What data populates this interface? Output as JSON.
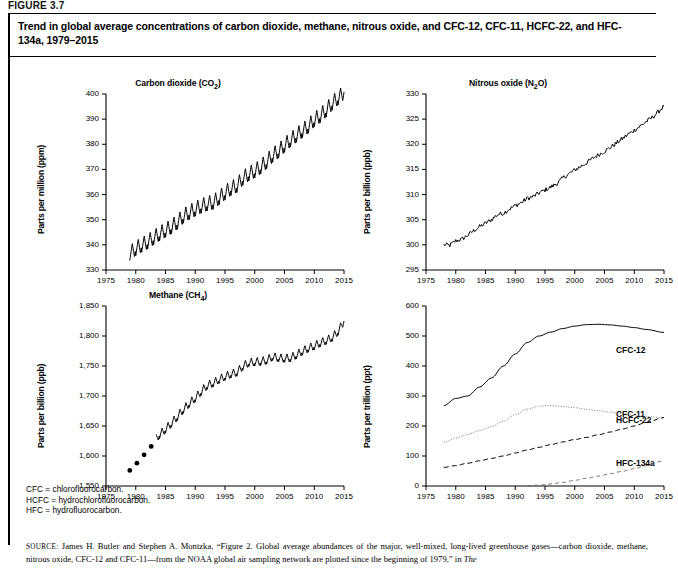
{
  "figure": {
    "label": "FIGURE 3.7",
    "title": "Trend in global average concentrations of carbon dioxide, methane, nitrous oxide, and CFC-12, CFC-11, HCFC-22, and HFC-134a, 1979–2015"
  },
  "notes": [
    "CFC = chlorofluorocarbon.",
    "HCFC = hydrochlorofluorocarbon.",
    "HFC = hydrofluorocarbon."
  ],
  "source": {
    "prefix": "SOURCE:",
    "text": " James H. Butler and Stephen A. Montzka, “Figure 2. Global average abundances of the major, well-mixed, long-lived greenhouse gases—carbon dioxide, methane, nitrous oxide, CFC-12 and CFC-11—from the NOAA global air sampling network are plotted since the beginning of 1979,” in ",
    "italic": "The"
  },
  "chart_data": [
    {
      "type": "line",
      "panel": "top-left",
      "title": "Carbon dioxide (CO₂)",
      "title_main": "Carbon dioxide (CO",
      "title_sub": "2",
      "title_end": ")",
      "ylabel": "Parts per million (ppm)",
      "xlabel": "",
      "ylim": [
        330,
        400
      ],
      "xlim": [
        1975,
        2015
      ],
      "yticks": [
        330,
        340,
        350,
        360,
        370,
        380,
        390,
        400
      ],
      "ytick_labels": [
        "330",
        "340",
        "350",
        "360",
        "370",
        "380",
        "390",
        "400"
      ],
      "xticks": [
        1975,
        1980,
        1985,
        1990,
        1995,
        2000,
        2005,
        2010,
        2015
      ],
      "xtick_labels": [
        "1975",
        "1980",
        "1985",
        "1990",
        "1995",
        "2000",
        "2005",
        "2010",
        "2015"
      ],
      "grid": false,
      "legend": "none",
      "series": [
        {
          "name": "CO2",
          "style": "solid-seasonal",
          "seasonal_amplitude": 3.0,
          "x": [
            1979,
            1980,
            1981,
            1982,
            1983,
            1984,
            1985,
            1986,
            1987,
            1988,
            1989,
            1990,
            1991,
            1992,
            1993,
            1994,
            1995,
            1996,
            1997,
            1998,
            1999,
            2000,
            2001,
            2002,
            2003,
            2004,
            2005,
            2006,
            2007,
            2008,
            2009,
            2010,
            2011,
            2012,
            2013,
            2014,
            2015
          ],
          "values": [
            336.8,
            338.7,
            340.1,
            341.4,
            343.0,
            344.6,
            346.0,
            347.4,
            349.2,
            351.6,
            353.1,
            354.4,
            355.6,
            356.5,
            357.1,
            358.9,
            360.9,
            362.6,
            363.8,
            366.7,
            368.4,
            369.6,
            371.2,
            373.3,
            375.8,
            377.5,
            379.8,
            381.9,
            383.8,
            385.6,
            387.4,
            389.9,
            391.6,
            393.8,
            396.5,
            398.6,
            400.8
          ]
        }
      ]
    },
    {
      "type": "line",
      "panel": "top-right",
      "title": "Nitrous oxide (N₂O)",
      "title_main": "Nitrous oxide (N",
      "title_sub": "2",
      "title_end": "O)",
      "ylabel": "Parts per billion (ppb)",
      "xlabel": "",
      "ylim": [
        295,
        330
      ],
      "xlim": [
        1975,
        2015
      ],
      "yticks": [
        295,
        300,
        305,
        310,
        315,
        320,
        325,
        330
      ],
      "ytick_labels": [
        "295",
        "300",
        "305",
        "310",
        "315",
        "320",
        "325",
        "330"
      ],
      "xticks": [
        1975,
        1980,
        1985,
        1990,
        1995,
        2000,
        2005,
        2010,
        2015
      ],
      "xtick_labels": [
        "1975",
        "1980",
        "1985",
        "1990",
        "1995",
        "2000",
        "2005",
        "2010",
        "2015"
      ],
      "grid": false,
      "legend": "none",
      "series": [
        {
          "name": "N2O",
          "style": "solid-noisy",
          "noise_amplitude": 0.45,
          "x": [
            1978,
            1979,
            1980,
            1981,
            1982,
            1983,
            1984,
            1985,
            1986,
            1987,
            1988,
            1989,
            1990,
            1991,
            1992,
            1993,
            1994,
            1995,
            1996,
            1997,
            1998,
            1999,
            2000,
            2001,
            2002,
            2003,
            2004,
            2005,
            2006,
            2007,
            2008,
            2009,
            2010,
            2011,
            2012,
            2013,
            2014,
            2015
          ],
          "values": [
            300.0,
            299.9,
            300.8,
            301.1,
            301.9,
            302.8,
            303.6,
            304.3,
            305.0,
            306.0,
            306.3,
            307.1,
            307.8,
            308.4,
            309.2,
            309.6,
            310.3,
            310.9,
            311.5,
            312.2,
            313.3,
            314.1,
            314.9,
            315.6,
            316.3,
            317.2,
            317.9,
            318.6,
            319.4,
            320.2,
            321.1,
            322.0,
            322.8,
            323.6,
            324.5,
            325.3,
            326.4,
            327.6
          ]
        }
      ]
    },
    {
      "type": "line",
      "panel": "bottom-left",
      "title": "Methane (CH₄)",
      "title_main": "Methane (CH",
      "title_sub": "4",
      "title_end": ")",
      "ylabel": "Parts per billion (ppb)",
      "xlabel": "",
      "ylim": [
        1550,
        1850
      ],
      "xlim": [
        1975,
        2015
      ],
      "yticks": [
        1550,
        1600,
        1650,
        1700,
        1750,
        1800,
        1850
      ],
      "ytick_labels": [
        "1,550",
        "1,600",
        "1,650",
        "1,700",
        "1,750",
        "1,800",
        "1,850"
      ],
      "xticks": [
        1975,
        1980,
        1985,
        1990,
        1995,
        2000,
        2005,
        2010,
        2015
      ],
      "xtick_labels": [
        "1975",
        "1980",
        "1985",
        "1990",
        "1995",
        "2000",
        "2005",
        "2010",
        "2015"
      ],
      "grid": false,
      "legend": "none",
      "series": [
        {
          "name": "CH4-markers",
          "style": "dots",
          "x": [
            1979,
            1980.2,
            1981.4,
            1982.6
          ],
          "values": [
            1576,
            1588,
            1602,
            1616
          ]
        },
        {
          "name": "CH4",
          "style": "solid-seasonal",
          "seasonal_amplitude": 7.0,
          "x": [
            1983.4,
            1984,
            1985,
            1986,
            1987,
            1988,
            1989,
            1990,
            1991,
            1992,
            1993,
            1994,
            1995,
            1996,
            1997,
            1998,
            1999,
            2000,
            2001,
            2002,
            2003,
            2004,
            2005,
            2006,
            2007,
            2008,
            2009,
            2010,
            2011,
            2012,
            2013,
            2014,
            2015
          ],
          "values": [
            1629,
            1636,
            1645,
            1655,
            1666,
            1678,
            1688,
            1697,
            1708,
            1718,
            1722,
            1728,
            1733,
            1737,
            1740,
            1750,
            1756,
            1757,
            1758,
            1760,
            1766,
            1764,
            1763,
            1764,
            1769,
            1775,
            1780,
            1784,
            1789,
            1793,
            1798,
            1808,
            1825
          ]
        }
      ]
    },
    {
      "type": "line",
      "panel": "bottom-right",
      "title": "",
      "ylabel": "Parts per trillion (ppt)",
      "xlabel": "",
      "ylim": [
        0,
        600
      ],
      "xlim": [
        1975,
        2015
      ],
      "yticks": [
        0,
        100,
        200,
        300,
        400,
        500,
        600
      ],
      "ytick_labels": [
        "0",
        "100",
        "200",
        "300",
        "400",
        "500",
        "600"
      ],
      "xticks": [
        1975,
        1980,
        1985,
        1990,
        1995,
        2000,
        2005,
        2010,
        2015
      ],
      "xtick_labels": [
        "1975",
        "1980",
        "1985",
        "1990",
        "1995",
        "2000",
        "2005",
        "2010",
        "2015"
      ],
      "grid": false,
      "legend": "inline-right",
      "series": [
        {
          "name": "CFC-12",
          "label": "CFC-12",
          "style": "solid",
          "x": [
            1978,
            1980,
            1982,
            1984,
            1986,
            1988,
            1990,
            1992,
            1994,
            1996,
            1998,
            2000,
            2002,
            2004,
            2006,
            2008,
            2010,
            2012,
            2015
          ],
          "values": [
            268,
            292,
            300,
            330,
            360,
            400,
            440,
            478,
            500,
            513,
            525,
            533,
            538,
            539,
            537,
            533,
            528,
            522,
            512
          ]
        },
        {
          "name": "CFC-11",
          "label": "CFC-11",
          "style": "dotted",
          "x": [
            1978,
            1980,
            1982,
            1984,
            1986,
            1988,
            1990,
            1992,
            1994,
            1996,
            1998,
            2000,
            2002,
            2004,
            2006,
            2008,
            2010,
            2012,
            2015
          ],
          "values": [
            146,
            160,
            172,
            185,
            198,
            216,
            238,
            256,
            266,
            268,
            265,
            261,
            256,
            251,
            246,
            241,
            236,
            232,
            227
          ]
        },
        {
          "name": "HCFC-22",
          "label": "HCFC-22",
          "style": "dashed",
          "x": [
            1978,
            1980,
            1982,
            1984,
            1986,
            1988,
            1990,
            1992,
            1994,
            1996,
            1998,
            2000,
            2002,
            2004,
            2006,
            2008,
            2010,
            2012,
            2015
          ],
          "values": [
            62,
            68,
            76,
            84,
            92,
            100,
            110,
            120,
            129,
            138,
            147,
            155,
            162,
            171,
            180,
            190,
            200,
            212,
            228
          ]
        },
        {
          "name": "HFC-134a",
          "label": "HFC-134a",
          "style": "dashed-thin",
          "x": [
            1992,
            1994,
            1996,
            1998,
            2000,
            2002,
            2004,
            2006,
            2008,
            2010,
            2012,
            2015
          ],
          "values": [
            1,
            3,
            7,
            12,
            19,
            26,
            33,
            41,
            49,
            58,
            68,
            84
          ]
        }
      ]
    }
  ]
}
